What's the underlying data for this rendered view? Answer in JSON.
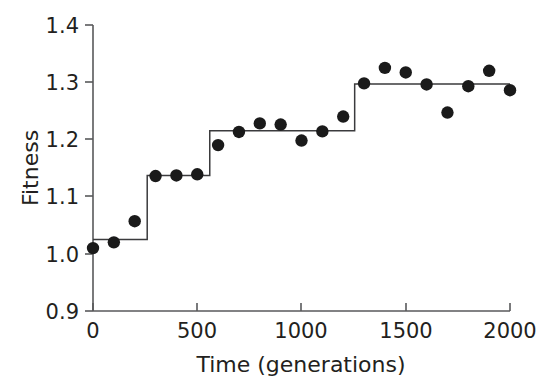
{
  "chart_data": {
    "type": "scatter",
    "title": "",
    "xlabel": "Time (generations)",
    "ylabel": "Fitness",
    "xlim": [
      0,
      2000
    ],
    "ylim": [
      0.9,
      1.4
    ],
    "xticks": [
      0,
      500,
      1000,
      1500,
      2000
    ],
    "xtick_labels": [
      "0",
      "500",
      "1000",
      "1500",
      "2000"
    ],
    "yticks": [
      0.9,
      1.0,
      1.1,
      1.2,
      1.3,
      1.4
    ],
    "ytick_labels": [
      "0.9",
      "1.0",
      "1.1",
      "1.2",
      "1.3",
      "1.4"
    ],
    "grid": false,
    "legend": "none",
    "marker": "filled-circle",
    "marker_color": "#1a1a1a",
    "line_color": "#3b3b3d",
    "axis_color": "#58595b",
    "series": [
      {
        "name": "Fitness measurements",
        "type": "scatter",
        "x": [
          0,
          100,
          200,
          300,
          400,
          500,
          600,
          700,
          800,
          900,
          1000,
          1100,
          1200,
          1300,
          1400,
          1500,
          1600,
          1700,
          1800,
          1900,
          2000
        ],
        "values": [
          1.01,
          1.02,
          1.057,
          1.136,
          1.137,
          1.139,
          1.19,
          1.213,
          1.228,
          1.226,
          1.198,
          1.214,
          1.24,
          1.298,
          1.325,
          1.317,
          1.296,
          1.247,
          1.293,
          1.32,
          1.286
        ]
      },
      {
        "name": "Step fit",
        "type": "step",
        "x": [
          0,
          260,
          260,
          560,
          560,
          1255,
          1255,
          2000
        ],
        "values": [
          1.025,
          1.025,
          1.137,
          1.137,
          1.215,
          1.215,
          1.297,
          1.297
        ],
        "step_levels": [
          1.025,
          1.137,
          1.215,
          1.297
        ],
        "step_breakpoints": [
          260,
          560,
          1255
        ]
      }
    ]
  },
  "axes": {
    "x_title": "Time (generations)",
    "y_title": "Fitness"
  }
}
